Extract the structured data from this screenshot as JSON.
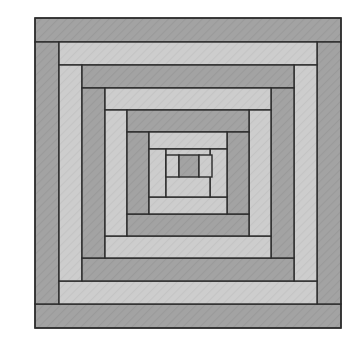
{
  "figure": {
    "name": "log-cabin-quilt-block",
    "canvas": {
      "width": 360,
      "height": 343
    },
    "background_color": "#ffffff"
  },
  "palette": {
    "dark_fabric": "#a3a3a3",
    "light_fabric": "#cdcdcd",
    "stroke": "#2b2b2b",
    "hatch_line": "#8f8f8f",
    "hatch_line_light": "#bdbdbd"
  },
  "block": {
    "outer_rect": {
      "x": 35,
      "y": 18,
      "width": 306,
      "height": 310
    },
    "stroke_width": 1.4,
    "ring_count": 6,
    "strip_orientation": {
      "top": "dark_fabric",
      "bottom": "dark_fabric",
      "left": "light_fabric",
      "right": "light_fabric"
    }
  },
  "rings": [
    {
      "index": 1,
      "label": "ring-1-outermost",
      "bounds": {
        "x": 35,
        "y": 18,
        "width": 306,
        "height": 310
      },
      "strip": 24,
      "top_fill": "#a3a3a3",
      "bottom_fill": "#a3a3a3",
      "left_fill": "#a3a3a3",
      "right_fill": "#a3a3a3"
    },
    {
      "index": 2,
      "label": "ring-2",
      "bounds": {
        "x": 59,
        "y": 42,
        "width": 258,
        "height": 262
      },
      "strip": 23,
      "top_fill": "#cdcdcd",
      "bottom_fill": "#cdcdcd",
      "left_fill": "#cdcdcd",
      "right_fill": "#cdcdcd"
    },
    {
      "index": 3,
      "label": "ring-3",
      "bounds": {
        "x": 82,
        "y": 65,
        "width": 212,
        "height": 216
      },
      "strip": 23,
      "top_fill": "#a3a3a3",
      "bottom_fill": "#a3a3a3",
      "left_fill": "#a3a3a3",
      "right_fill": "#a3a3a3"
    },
    {
      "index": 4,
      "label": "ring-4",
      "bounds": {
        "x": 105,
        "y": 88,
        "width": 166,
        "height": 170
      },
      "strip": 22,
      "top_fill": "#cdcdcd",
      "bottom_fill": "#cdcdcd",
      "left_fill": "#cdcdcd",
      "right_fill": "#cdcdcd"
    },
    {
      "index": 5,
      "label": "ring-5",
      "bounds": {
        "x": 127,
        "y": 110,
        "width": 122,
        "height": 126
      },
      "strip": 22,
      "top_fill": "#a3a3a3",
      "bottom_fill": "#a3a3a3",
      "left_fill": "#a3a3a3",
      "right_fill": "#a3a3a3"
    },
    {
      "index": 6,
      "label": "ring-6-innermost",
      "bounds": {
        "x": 149,
        "y": 132,
        "width": 78,
        "height": 82
      },
      "strip": 17,
      "top_fill": "#cdcdcd",
      "bottom_fill": "#cdcdcd",
      "left_fill": "#cdcdcd",
      "right_fill": "#cdcdcd"
    }
  ],
  "center": {
    "label": "center-square",
    "bounds": {
      "x": 179,
      "y": 155,
      "width": 20,
      "height": 22
    },
    "fill": "#a3a3a3",
    "left_neighbor": {
      "x": 166,
      "y": 155,
      "width": 13,
      "height": 22,
      "fill": "#cdcdcd"
    },
    "right_neighbor": {
      "x": 199,
      "y": 155,
      "width": 13,
      "height": 22,
      "fill": "#cdcdcd"
    }
  },
  "legend": {
    "dark_label": "Dark fabric",
    "light_label": "Light fabric",
    "center_label": "Center square"
  }
}
